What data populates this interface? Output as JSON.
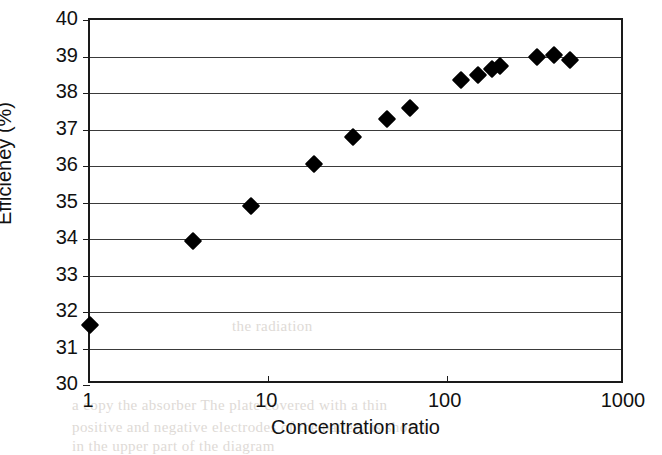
{
  "figure": {
    "width": 662,
    "height": 449,
    "background_color": "#ffffff",
    "ink_color": "#000000"
  },
  "bleed_through": [
    {
      "text": "a copy  the  absorber  The  plate  covered  with  a  thin",
      "x": 72,
      "y": 397
    },
    {
      "text": "positive  and  negative  electrodes  of  the  battery  is  shown",
      "x": 72,
      "y": 419
    },
    {
      "text": "in  the  upper  part  of  the  diagram",
      "x": 72,
      "y": 438
    },
    {
      "text": "the  radiation",
      "x": 232,
      "y": 318
    }
  ],
  "chart_data": {
    "type": "scatter",
    "title": "",
    "xlabel": "Concentration ratio",
    "ylabel": "Efficieney (%)",
    "xscale": "log",
    "yscale": "linear",
    "xlim": [
      1,
      1000
    ],
    "ylim": [
      30,
      40
    ],
    "xticks": [
      1,
      10,
      100,
      1000
    ],
    "xticklabels": [
      "1",
      "10",
      "100",
      "1000"
    ],
    "yticks": [
      30,
      31,
      32,
      33,
      34,
      35,
      36,
      37,
      38,
      39,
      40
    ],
    "yticklabels": [
      "30",
      "31",
      "32",
      "33",
      "34",
      "35",
      "36",
      "37",
      "38",
      "39",
      "40"
    ],
    "grid": "horizontal",
    "legend": "none",
    "marker_style": "filled-diamond",
    "marker_color": "#000000",
    "series": [
      {
        "name": "Efficiency vs concentration ratio",
        "points": [
          {
            "x": 1.0,
            "y": 31.65
          },
          {
            "x": 3.8,
            "y": 33.95
          },
          {
            "x": 8.0,
            "y": 34.9
          },
          {
            "x": 18.0,
            "y": 36.05
          },
          {
            "x": 30.0,
            "y": 36.8
          },
          {
            "x": 46.0,
            "y": 37.3
          },
          {
            "x": 62.0,
            "y": 37.6
          },
          {
            "x": 120.0,
            "y": 38.35
          },
          {
            "x": 150.0,
            "y": 38.5
          },
          {
            "x": 180.0,
            "y": 38.65
          },
          {
            "x": 200.0,
            "y": 38.75
          },
          {
            "x": 320.0,
            "y": 39.0
          },
          {
            "x": 400.0,
            "y": 39.05
          },
          {
            "x": 490.0,
            "y": 38.9
          }
        ]
      }
    ]
  }
}
